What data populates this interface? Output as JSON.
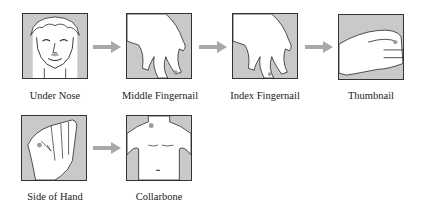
{
  "steps": [
    {
      "label": "Under Nose",
      "icon": "face-icon"
    },
    {
      "label": "Middle Fingernail",
      "icon": "hand-middle-finger-icon"
    },
    {
      "label": "Index Fingernail",
      "icon": "hand-index-finger-icon"
    },
    {
      "label": "Thumbnail",
      "icon": "hand-thumb-icon"
    },
    {
      "label": "Side of Hand",
      "icon": "fist-side-icon"
    },
    {
      "label": "Collarbone",
      "icon": "torso-collarbone-icon"
    }
  ],
  "colors": {
    "arrow": "#a8a8a8",
    "box_bg": "#c9c9c9",
    "border": "#333333"
  }
}
